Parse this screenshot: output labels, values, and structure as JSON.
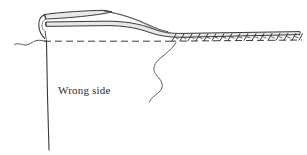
{
  "figure": {
    "kind": "sewing-hem-diagram",
    "background_color": "#ffffff",
    "width": 307,
    "height": 155
  },
  "labels": {
    "wrong_side": "Wrong side"
  },
  "colors": {
    "outline": "#3a3a3a",
    "fabric_fill": "#e8e8e8",
    "fabric_fill_light": "#f2f2f2",
    "fold_line": "#3a3a3a",
    "stitch": "#2f2f2f",
    "leader": "#4a4a4a",
    "text": "#2b2b2b"
  },
  "elements": {
    "folded_band_upper": "folded-hem-band-upper",
    "folded_band_lower": "folded-hem-band-lower",
    "fold_curve_left": "rolled-fold-end",
    "fold_dashed_line": "fold-line-dashed",
    "stitch_row": "serged-edge-stitching",
    "leader_left": "leader-squiggle-left",
    "leader_center": "leader-squiggle-center",
    "edge_vertical": "fabric-edge-vertical",
    "tapered_seam": "tapered-seam-line"
  },
  "stitching": {
    "count": 17,
    "start_x": 172,
    "end_x": 300,
    "baseline_y": 41,
    "height": 7,
    "slant": 3
  }
}
